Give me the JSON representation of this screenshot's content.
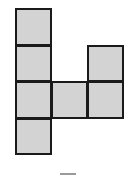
{
  "figure": {
    "type": "net-of-squares",
    "fill_color": "#d3d3d3",
    "border_color": "#1a1a1a",
    "cells": [
      {
        "col": 0,
        "row": 0
      },
      {
        "col": 0,
        "row": 1
      },
      {
        "col": 0,
        "row": 2
      },
      {
        "col": 0,
        "row": 3
      },
      {
        "col": 1,
        "row": 2
      },
      {
        "col": 2,
        "row": 1
      },
      {
        "col": 2,
        "row": 2
      }
    ],
    "cell_size_px": 37,
    "origin_px": [
      15,
      8
    ]
  },
  "caption": ""
}
